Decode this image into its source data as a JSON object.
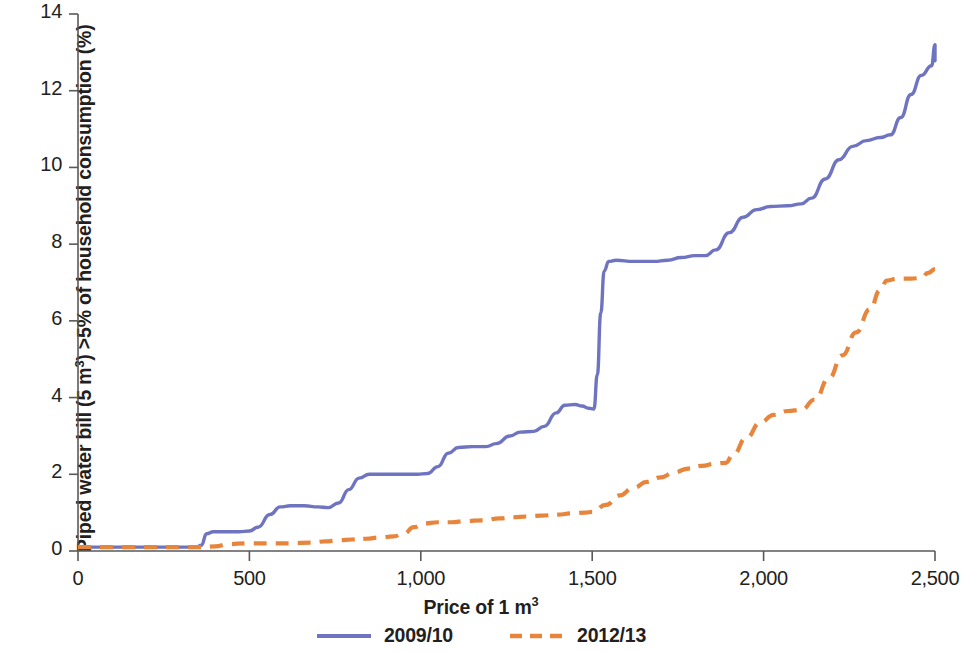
{
  "chart_data": {
    "type": "line",
    "title": "",
    "xlabel": "Price of 1 m³",
    "xlabel_html": "Price of 1 m<sup>3</sup>",
    "ylabel": "Piped water bill (5 m³) >5% of household consumption (%)",
    "xlim": [
      0,
      2500
    ],
    "ylim": [
      0,
      14
    ],
    "xticks": [
      0,
      500,
      1000,
      1500,
      2000,
      2500
    ],
    "xtick_labels": [
      "0",
      "500",
      "1,000",
      "1,500",
      "2,000",
      "2,500"
    ],
    "yticks": [
      0,
      2,
      4,
      6,
      8,
      10,
      12,
      14
    ],
    "ytick_labels": [
      "0",
      "2",
      "4",
      "6",
      "8",
      "10",
      "12",
      "14"
    ],
    "grid": false,
    "legend_position": "below",
    "series": [
      {
        "name": "2009/10",
        "color": "#6f74c0",
        "style": "solid",
        "points": [
          [
            0,
            0.1
          ],
          [
            100,
            0.1
          ],
          [
            200,
            0.1
          ],
          [
            300,
            0.1
          ],
          [
            345,
            0.1
          ],
          [
            360,
            0.15
          ],
          [
            375,
            0.45
          ],
          [
            395,
            0.5
          ],
          [
            440,
            0.5
          ],
          [
            470,
            0.5
          ],
          [
            500,
            0.52
          ],
          [
            525,
            0.62
          ],
          [
            560,
            0.95
          ],
          [
            590,
            1.15
          ],
          [
            620,
            1.18
          ],
          [
            660,
            1.18
          ],
          [
            700,
            1.15
          ],
          [
            730,
            1.13
          ],
          [
            760,
            1.25
          ],
          [
            790,
            1.6
          ],
          [
            820,
            1.9
          ],
          [
            850,
            2.0
          ],
          [
            890,
            2.0
          ],
          [
            940,
            2.0
          ],
          [
            990,
            2.0
          ],
          [
            1020,
            2.02
          ],
          [
            1050,
            2.2
          ],
          [
            1080,
            2.55
          ],
          [
            1110,
            2.7
          ],
          [
            1150,
            2.72
          ],
          [
            1190,
            2.72
          ],
          [
            1220,
            2.8
          ],
          [
            1260,
            3.0
          ],
          [
            1290,
            3.1
          ],
          [
            1330,
            3.12
          ],
          [
            1360,
            3.25
          ],
          [
            1395,
            3.6
          ],
          [
            1420,
            3.8
          ],
          [
            1450,
            3.82
          ],
          [
            1470,
            3.78
          ],
          [
            1490,
            3.72
          ],
          [
            1505,
            3.7
          ],
          [
            1515,
            4.6
          ],
          [
            1525,
            6.2
          ],
          [
            1535,
            7.3
          ],
          [
            1548,
            7.55
          ],
          [
            1570,
            7.58
          ],
          [
            1620,
            7.55
          ],
          [
            1680,
            7.55
          ],
          [
            1720,
            7.58
          ],
          [
            1760,
            7.65
          ],
          [
            1800,
            7.7
          ],
          [
            1830,
            7.7
          ],
          [
            1860,
            7.85
          ],
          [
            1900,
            8.3
          ],
          [
            1940,
            8.7
          ],
          [
            1980,
            8.9
          ],
          [
            2020,
            8.98
          ],
          [
            2070,
            9.0
          ],
          [
            2110,
            9.05
          ],
          [
            2140,
            9.2
          ],
          [
            2180,
            9.7
          ],
          [
            2220,
            10.2
          ],
          [
            2260,
            10.55
          ],
          [
            2300,
            10.7
          ],
          [
            2340,
            10.78
          ],
          [
            2370,
            10.85
          ],
          [
            2400,
            11.3
          ],
          [
            2430,
            11.9
          ],
          [
            2460,
            12.4
          ],
          [
            2490,
            12.65
          ],
          [
            2530,
            12.78
          ],
          [
            2570,
            12.85
          ],
          [
            2600,
            12.95
          ],
          [
            2630,
            13.1
          ],
          [
            2660,
            13.15
          ],
          [
            2500,
            13.2
          ]
        ]
      },
      {
        "name": "2012/13",
        "color": "#e8853c",
        "style": "dashed",
        "points": [
          [
            0,
            0.1
          ],
          [
            150,
            0.1
          ],
          [
            300,
            0.1
          ],
          [
            360,
            0.1
          ],
          [
            400,
            0.12
          ],
          [
            440,
            0.18
          ],
          [
            490,
            0.2
          ],
          [
            560,
            0.2
          ],
          [
            620,
            0.2
          ],
          [
            680,
            0.22
          ],
          [
            720,
            0.25
          ],
          [
            760,
            0.28
          ],
          [
            800,
            0.3
          ],
          [
            840,
            0.32
          ],
          [
            880,
            0.35
          ],
          [
            920,
            0.38
          ],
          [
            950,
            0.45
          ],
          [
            980,
            0.62
          ],
          [
            1010,
            0.72
          ],
          [
            1050,
            0.75
          ],
          [
            1090,
            0.75
          ],
          [
            1130,
            0.78
          ],
          [
            1180,
            0.8
          ],
          [
            1230,
            0.85
          ],
          [
            1270,
            0.88
          ],
          [
            1310,
            0.9
          ],
          [
            1350,
            0.92
          ],
          [
            1400,
            0.95
          ],
          [
            1440,
            0.98
          ],
          [
            1480,
            1.0
          ],
          [
            1500,
            1.02
          ],
          [
            1540,
            1.2
          ],
          [
            1580,
            1.45
          ],
          [
            1620,
            1.65
          ],
          [
            1660,
            1.8
          ],
          [
            1700,
            1.92
          ],
          [
            1740,
            2.05
          ],
          [
            1780,
            2.15
          ],
          [
            1820,
            2.22
          ],
          [
            1860,
            2.28
          ],
          [
            1890,
            2.3
          ],
          [
            1910,
            2.5
          ],
          [
            1950,
            2.95
          ],
          [
            1990,
            3.35
          ],
          [
            2030,
            3.55
          ],
          [
            2070,
            3.65
          ],
          [
            2110,
            3.68
          ],
          [
            2150,
            3.95
          ],
          [
            2190,
            4.5
          ],
          [
            2230,
            5.1
          ],
          [
            2270,
            5.7
          ],
          [
            2310,
            6.3
          ],
          [
            2340,
            6.8
          ],
          [
            2360,
            7.05
          ],
          [
            2390,
            7.1
          ],
          [
            2430,
            7.1
          ],
          [
            2460,
            7.12
          ],
          [
            2480,
            7.25
          ],
          [
            2500,
            7.35
          ]
        ]
      }
    ]
  },
  "axes": {
    "y_axis_label_html": "Piped water bill (5 m<sup>3</sup>) &gt;5% of household consumption (%)",
    "axis_color": "#58595b"
  },
  "legend": {
    "items": [
      {
        "label": "2009/10",
        "color": "#6f74c0",
        "style": "solid"
      },
      {
        "label": "2012/13",
        "color": "#e8853c",
        "style": "dashed"
      }
    ]
  }
}
